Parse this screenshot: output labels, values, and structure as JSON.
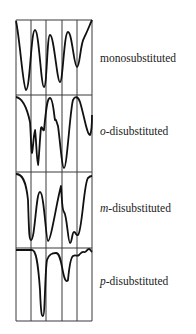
{
  "figure": {
    "panels": [
      {
        "id": "mono",
        "label_prefix": "",
        "label_rest": "monosubstituted",
        "y_top": 20,
        "y_bottom": 95,
        "label_y": 51,
        "curve": "M16,21 C20,40 23,88 26,90 C30,90 31,30 35,30 C39,30 41,87 44,87 C47,87 47,35 50,35 C54,35 57,82 60,82 C63,82 64,32 68,32 C72,32 74,67 77,67 C80,67 80,45 84,38 C88,30 90,24 92,20"
      },
      {
        "id": "ortho",
        "label_prefix": "o",
        "label_rest": "-disubstituted",
        "y_top": 95,
        "y_bottom": 172,
        "label_y": 124,
        "curve": "M16,97 C22,98 27,108 30,122 C31,135 31,150 32,153 C33,150 34,130 35,130 C36,135 37,165 38,165 C39,160 40,135 41,128 C42,125 43,132 44,130 C46,110 47,98 50,98 C53,98 54,115 55,120 C56,118 57,124 58,126 C60,140 62,168 64,168 C67,168 70,110 73,100 C75,96 78,96 80,102 C84,115 87,135 90,135 C91,133 92,125 92,115"
      },
      {
        "id": "meta",
        "label_prefix": "m",
        "label_rest": "-disubstituted",
        "y_top": 172,
        "y_bottom": 248,
        "label_y": 201,
        "curve": "M16,174 C22,174 26,180 28,200 C29,230 29,240 31,240 C35,240 36,192 40,192 C44,192 46,241 48,241 C51,241 57,200 61,186 C62,200 62,210 64,212 C67,215 68,243 70,243 C72,243 72,232 74,232 C76,232 76,236 78,235 C82,232 84,182 88,178 C90,176 91,176 92,176"
      },
      {
        "id": "para",
        "label_prefix": "p",
        "label_rest": "-disubstituted",
        "y_top": 248,
        "y_bottom": 321,
        "label_y": 274,
        "curve": "M16,250 L32,250 C36,250 38,262 40,290 C41,316 42,316 43,316 C45,316 45,270 47,260 C49,254 52,253 56,253 C60,253 61,262 63,272 C65,282 67,282 68,280 C69,270 70,258 73,256 C76,254 77,257 79,255 C81,253 82,251 84,252 C86,253 87,249 89,249 C90,249 91,251 92,252"
      }
    ],
    "grid": {
      "x_lines": [
        16,
        31,
        46,
        62,
        77,
        92
      ],
      "y_lines": [
        20,
        95,
        172,
        248,
        321
      ],
      "stroke": "#3a3a3a"
    },
    "curve_color": "#111111"
  }
}
